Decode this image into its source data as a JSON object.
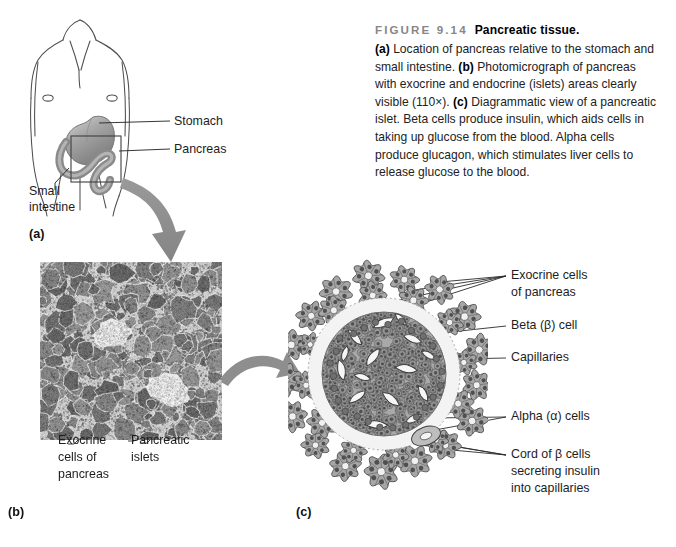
{
  "figure": {
    "number": "FIGURE 9.14",
    "title": "Pancreatic tissue.",
    "caption_parts": {
      "a_tag": "(a)",
      "a_text": " Location of pancreas relative to the stomach and small intestine. ",
      "b_tag": "(b)",
      "b_text": " Photomicrograph of pancreas with exocrine and endocrine (islets) areas clearly visible (110×). ",
      "c_tag": "(c)",
      "c_text": " Diagrammatic view of a pancreatic islet. Beta cells produce insulin, which aids cells in taking up glucose from the blood. Alpha cells produce glucagon, which stimulates liver cells to release glucose to the blood."
    }
  },
  "panel_a": {
    "id": "(a)",
    "labels": {
      "stomach": "Stomach",
      "pancreas": "Pancreas",
      "small_intestine_line1": "Small",
      "small_intestine_line2": "intestine"
    }
  },
  "panel_b": {
    "id": "(b)",
    "labels": {
      "exocrine_line1": "Exocrine",
      "exocrine_line2": "cells of",
      "exocrine_line3": "pancreas",
      "islets_line1": "Pancreatic",
      "islets_line2": "islets"
    }
  },
  "panel_c": {
    "id": "(c)",
    "labels": {
      "exocrine_line1": "Exocrine cells",
      "exocrine_line2": "of pancreas",
      "beta_cell": "Beta (β) cell",
      "capillaries": "Capillaries",
      "alpha_cells": "Alpha (α) cells",
      "cord_line1": "Cord of β cells",
      "cord_line2": "secreting insulin",
      "cord_line3": "into capillaries"
    }
  },
  "colors": {
    "figure_number": "#878787",
    "text": "#1d1d1d",
    "arrow_gray": "#8c8c8c",
    "outline": "#4a4a4a",
    "organ_gray": "#9b9b9b"
  }
}
